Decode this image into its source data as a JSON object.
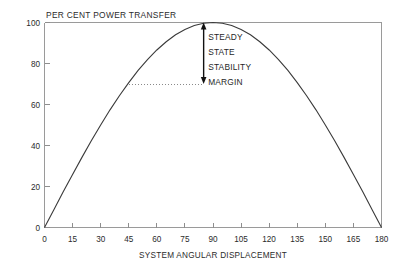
{
  "chart_data": {
    "type": "line",
    "title": "PER CENT POWER TRANSFER",
    "xlabel": "SYSTEM ANGULAR DISPLACEMENT",
    "ylabel": "PER CENT POWER TRANSFER",
    "xlim": [
      0,
      180
    ],
    "ylim": [
      0,
      100
    ],
    "grid": false,
    "legend": "none",
    "x_ticks": [
      "0",
      "15",
      "30",
      "45",
      "60",
      "75",
      "90",
      "105",
      "120",
      "135",
      "150",
      "165",
      "180"
    ],
    "x_tick_values": [
      0,
      15,
      30,
      45,
      60,
      75,
      90,
      105,
      120,
      135,
      150,
      165,
      180
    ],
    "y_ticks": [
      "0",
      "20",
      "40",
      "60",
      "80",
      "100"
    ],
    "y_tick_values": [
      0,
      20,
      40,
      60,
      80,
      100
    ],
    "series": [
      {
        "name": "Power transfer curve",
        "description": "Sinusoidal power-angle curve, P = 100 sin(delta)",
        "x": [
          0,
          5,
          10,
          15,
          20,
          25,
          30,
          35,
          40,
          45,
          50,
          55,
          60,
          65,
          70,
          75,
          80,
          85,
          90,
          95,
          100,
          105,
          110,
          115,
          120,
          125,
          130,
          135,
          140,
          145,
          150,
          155,
          160,
          165,
          170,
          175,
          180
        ],
        "values": [
          0,
          8.7,
          17.4,
          25.9,
          34.2,
          42.3,
          50.0,
          57.4,
          64.3,
          70.7,
          76.6,
          81.9,
          86.6,
          90.6,
          94.0,
          96.6,
          98.5,
          99.6,
          100.0,
          99.6,
          98.5,
          96.6,
          94.0,
          90.6,
          86.6,
          81.9,
          76.6,
          70.7,
          64.3,
          57.4,
          50.0,
          42.3,
          34.2,
          25.9,
          17.4,
          8.7,
          0
        ]
      }
    ],
    "annotations": [
      {
        "name": "steady-state-stability-margin",
        "lines": [
          "STEADY",
          "STATE",
          "STABILITY",
          "MARGIN"
        ],
        "arrow_x": 85,
        "arrow_top_value": 100,
        "arrow_bottom_value": 70,
        "guide_line_from_x": 45,
        "guide_line_to_x": 85,
        "guide_line_value": 70
      }
    ],
    "colors": {
      "curve": "#3a3a3a",
      "frame": "#9a9a9a",
      "arrow": "#111111",
      "guide": "#8a8a8a",
      "text": "#2b2b2b",
      "background": "#ffffff"
    }
  }
}
